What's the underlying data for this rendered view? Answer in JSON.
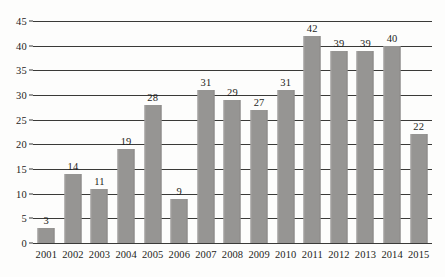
{
  "chart_data": {
    "type": "bar",
    "title": "",
    "subtitle": "",
    "xlabel": "",
    "ylabel": "",
    "categories": [
      "2001",
      "2002",
      "2003",
      "2004",
      "2005",
      "2006",
      "2007",
      "2008",
      "2009",
      "2010",
      "2011",
      "2012",
      "2013",
      "2014",
      "2015"
    ],
    "values": [
      3,
      14,
      11,
      19,
      28,
      9,
      31,
      29,
      27,
      31,
      42,
      39,
      39,
      40,
      22
    ],
    "data_labels": [
      "3",
      "14",
      "11",
      "19",
      "28",
      "9",
      "31",
      "29",
      "27",
      "31",
      "42",
      "39",
      "39",
      "40",
      "22"
    ],
    "ylim": [
      0,
      45
    ],
    "ytick_step": 5,
    "yticks": [
      0,
      5,
      10,
      15,
      20,
      25,
      30,
      35,
      40,
      45
    ],
    "ytick_labels": [
      "0",
      "5",
      "10",
      "15",
      "20",
      "25",
      "30",
      "35",
      "40",
      "45"
    ],
    "grid": true,
    "grid_orientation": "horizontal",
    "legend": false,
    "legend_position": "none",
    "series": [
      {
        "name": "",
        "values": [
          3,
          14,
          11,
          19,
          28,
          9,
          31,
          29,
          27,
          31,
          42,
          39,
          39,
          40,
          22
        ]
      }
    ]
  },
  "style": {
    "bar_color": "#969593",
    "grid_color": "#3a3a38",
    "text_color": "#1d1d1b",
    "background_color": "#fdfdfc"
  }
}
